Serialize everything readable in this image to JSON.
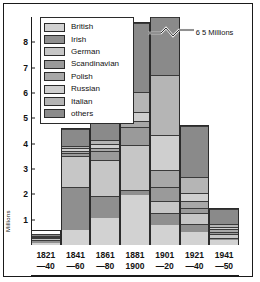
{
  "chart_data": {
    "type": "bar",
    "subtype": "stacked",
    "title": "",
    "xlabel": "",
    "ylabel": "Millions",
    "ylim": [
      0,
      9
    ],
    "yticks": [
      1,
      2,
      3,
      4,
      5,
      6,
      7,
      8
    ],
    "grid": false,
    "legend_position": "top-left",
    "categories": [
      "1821—40",
      "1841—60",
      "1861—80",
      "1881—1900",
      "1901—20",
      "1921—40",
      "1941—50"
    ],
    "category_lines": [
      {
        "top": "1821",
        "bottom": "—40"
      },
      {
        "top": "1841",
        "bottom": "—60"
      },
      {
        "top": "1861",
        "bottom": "—80"
      },
      {
        "top": "1881",
        "bottom": "1900"
      },
      {
        "top": "1901",
        "bottom": "—20"
      },
      {
        "top": "1921",
        "bottom": "—40"
      },
      {
        "top": "1941",
        "bottom": "—50"
      }
    ],
    "series": [
      {
        "name": "British",
        "color": "#d2d2d2",
        "values": [
          0.26,
          0.65,
          1.15,
          2.05,
          0.85,
          0.55,
          0.25
        ]
      },
      {
        "name": "Irish",
        "color": "#8f8f8f",
        "values": [
          0.21,
          1.75,
          0.88,
          0.18,
          0.48,
          0.28,
          0.06
        ]
      },
      {
        "name": "German",
        "color": "#c6c6c6",
        "values": [
          0.09,
          1.3,
          1.45,
          1.8,
          0.48,
          0.42,
          0.14
        ]
      },
      {
        "name": "Scandinavian",
        "color": "#9a9a9a",
        "values": [
          0.01,
          0.08,
          0.34,
          0.66,
          0.57,
          0.2,
          0.06
        ]
      },
      {
        "name": "Polish",
        "color": "#a8a8a8",
        "values": [
          0.0,
          0.04,
          0.1,
          0.22,
          0.66,
          0.24,
          0.08
        ]
      },
      {
        "name": "Russian",
        "color": "#cfcfcf",
        "values": [
          0.0,
          0.06,
          0.12,
          0.32,
          1.46,
          0.3,
          0.07
        ]
      },
      {
        "name": "Italian",
        "color": "#b5b5b5",
        "values": [
          0.01,
          0.05,
          0.12,
          0.78,
          2.55,
          0.62,
          0.09
        ]
      },
      {
        "name": "others",
        "color": "#8a8a8a",
        "values": [
          0.03,
          0.67,
          1.14,
          2.79,
          2.45,
          2.14,
          0.7
        ]
      }
    ],
    "totals": [
      0.61,
      4.6,
      5.3,
      8.8,
      9.5,
      4.75,
      1.45
    ],
    "annotations": [
      {
        "text": "6 5 Millions",
        "target_category": "1901—20",
        "note": "bar clipped with axis-break zigzag"
      }
    ]
  },
  "axis": {
    "y_unit_label": "Millions"
  }
}
